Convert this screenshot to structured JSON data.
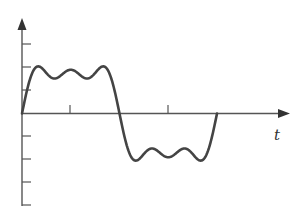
{
  "chart_data": {
    "type": "line",
    "title": "",
    "xlabel": "t",
    "ylabel": "",
    "grid": false,
    "legend": null,
    "x_ticks_count": 2,
    "y_ticks": {
      "above_axis": 3,
      "below_axis": 4
    },
    "xlim": [
      0,
      6.2832
    ],
    "ylim": [
      -1.0,
      1.0
    ],
    "series": [
      {
        "name": "f(t)",
        "color": "#444444",
        "harmonics": [
          {
            "n": 1,
            "coef": 1
          },
          {
            "n": 3,
            "coef": 0.3333
          },
          {
            "n": 5,
            "coef": 0.2
          }
        ],
        "x": [
          0,
          0.25,
          0.5,
          0.75,
          1.0,
          1.25,
          1.5708,
          1.9,
          2.15,
          2.4,
          2.65,
          2.9,
          3.1416,
          3.4,
          3.64,
          3.9,
          4.15,
          4.4,
          4.7124,
          5.0,
          5.28,
          5.53,
          5.78,
          6.03,
          6.2832
        ],
        "values": [
          0,
          0.7,
          0.93,
          0.76,
          0.72,
          0.85,
          0.87,
          0.82,
          0.72,
          0.76,
          0.93,
          0.71,
          0,
          -0.71,
          -0.93,
          -0.76,
          -0.72,
          -0.85,
          -0.87,
          -0.82,
          -0.72,
          -0.76,
          -0.93,
          -0.7,
          0
        ]
      }
    ],
    "annotations": []
  },
  "axis_label": {
    "t": "t"
  },
  "colors": {
    "axis": "#555555",
    "curve": "#444444",
    "background": "#ffffff"
  }
}
